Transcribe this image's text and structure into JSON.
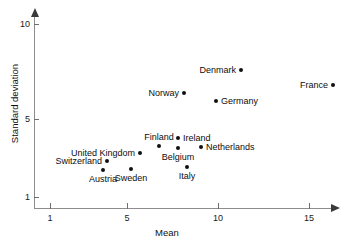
{
  "chart_data": {
    "type": "scatter",
    "title": "",
    "xlabel": "Mean",
    "ylabel": "Standard deviation",
    "grid": false,
    "legend": "none",
    "xscale": "log",
    "yscale": "log",
    "xticks": [
      1,
      5,
      10,
      15
    ],
    "xtick_labels": [
      "1",
      "5",
      "10",
      "15"
    ],
    "yticks": [
      1,
      5,
      10
    ],
    "ytick_labels": [
      "1",
      "5",
      "10"
    ],
    "xlim": [
      0.85,
      17.5
    ],
    "ylim": [
      0.8,
      11
    ],
    "point_labels": [
      "Denmark",
      "France",
      "Norway",
      "Germany",
      "Ireland",
      "Finland",
      "Belgium",
      "Netherlands",
      "United Kingdom",
      "Switzerland",
      "Austria",
      "Sweden",
      "Italy"
    ],
    "points": [
      {
        "label": "Denmark",
        "x": 11.2,
        "y": 7.5,
        "label_side": "left",
        "px": 241,
        "py": 70
      },
      {
        "label": "France",
        "x": 16.2,
        "y": 6.8,
        "label_side": "left",
        "px": 333,
        "py": 85
      },
      {
        "label": "Norway",
        "x": 8.0,
        "y": 6.3,
        "label_side": "left",
        "px": 184,
        "py": 93
      },
      {
        "label": "Germany",
        "x": 9.9,
        "y": 5.9,
        "label_side": "right",
        "px": 216,
        "py": 101
      },
      {
        "label": "Ireland",
        "x": 8.1,
        "y": 3.9,
        "label_side": "right",
        "px": 178,
        "py": 138
      },
      {
        "label": "Finland",
        "x": 6.9,
        "y": 3.4,
        "label_side": "above",
        "px": 159,
        "py": 146
      },
      {
        "label": "Belgium",
        "x": 8.1,
        "y": 3.3,
        "label_side": "below",
        "px": 178,
        "py": 148
      },
      {
        "label": "Netherlands",
        "x": 9.1,
        "y": 3.0,
        "label_side": "right",
        "px": 201,
        "py": 147
      },
      {
        "label": "United Kingdom",
        "x": 5.8,
        "y": 2.9,
        "label_side": "left",
        "px": 140,
        "py": 153
      },
      {
        "label": "Switzerland",
        "x": 3.8,
        "y": 2.0,
        "label_side": "left",
        "px": 107,
        "py": 161
      },
      {
        "label": "Austria",
        "x": 3.7,
        "y": 1.75,
        "label_side": "below",
        "px": 103,
        "py": 170
      },
      {
        "label": "Sweden",
        "x": 5.2,
        "y": 1.7,
        "label_side": "below",
        "px": 131,
        "py": 169
      },
      {
        "label": "Italy",
        "x": 8.4,
        "y": 2.0,
        "label_side": "below",
        "px": 187,
        "py": 167
      }
    ]
  },
  "axes": {
    "x": {
      "title": "Mean",
      "ticks": [
        {
          "label": "1",
          "px": 50
        },
        {
          "label": "5",
          "px": 127
        },
        {
          "label": "10",
          "px": 218
        },
        {
          "label": "15",
          "px": 309
        }
      ]
    },
    "y": {
      "title": "Standard deviation",
      "ticks": [
        {
          "label": "10",
          "py": 24
        },
        {
          "label": "5",
          "py": 119
        },
        {
          "label": "1",
          "py": 197
        }
      ]
    }
  }
}
